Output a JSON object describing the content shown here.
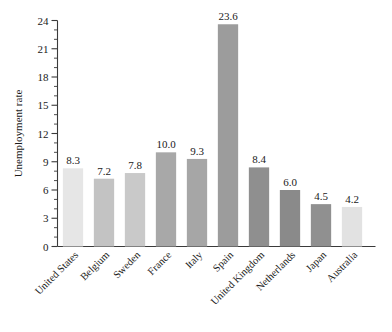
{
  "chart_data": {
    "type": "bar",
    "title": "",
    "xlabel": "",
    "ylabel": "Unemployment rate",
    "ylim": [
      0,
      24
    ],
    "ytick_values": [
      0,
      3,
      6,
      9,
      12,
      15,
      18,
      21,
      24
    ],
    "ytick_labels": [
      "0",
      "3",
      "6",
      "9",
      "12",
      "15",
      "18",
      "21",
      "24"
    ],
    "minor_tick_step": 1,
    "grid": false,
    "legend": "none",
    "categories": [
      "United States",
      "Belgium",
      "Sweden",
      "France",
      "Italy",
      "Spain",
      "United Kingdom",
      "Netherlands",
      "Japan",
      "Australia"
    ],
    "values": [
      8.3,
      7.2,
      7.8,
      10.0,
      9.3,
      23.6,
      8.4,
      6.0,
      4.5,
      4.2
    ],
    "value_labels": [
      "8.3",
      "7.2",
      "7.8",
      "10.0",
      "9.3",
      "23.6",
      "8.4",
      "6.0",
      "4.5",
      "4.2"
    ],
    "bar_colors": [
      "#e6e6e6",
      "#c3c3c3",
      "#c9c9c9",
      "#a8a8a8",
      "#a6a6a6",
      "#9c9c9c",
      "#8f8f8f",
      "#8a8a8a",
      "#909090",
      "#e2e2e2"
    ]
  }
}
